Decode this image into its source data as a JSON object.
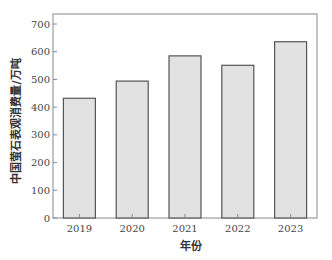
{
  "chart_data": {
    "type": "bar",
    "title": "",
    "xlabel": "年份",
    "ylabel": "中国萤石表观消费量/万吨",
    "categories": [
      "2019",
      "2020",
      "2021",
      "2022",
      "2023"
    ],
    "values": [
      432,
      494,
      585,
      551,
      636
    ],
    "ylim": [
      0,
      750
    ],
    "yticks": [
      0,
      100,
      200,
      300,
      400,
      500,
      600,
      700
    ],
    "grid": false,
    "legend": null,
    "bar_fill": "#e2e2e2",
    "bar_stroke": "#555555",
    "axis_color": "#888888"
  }
}
